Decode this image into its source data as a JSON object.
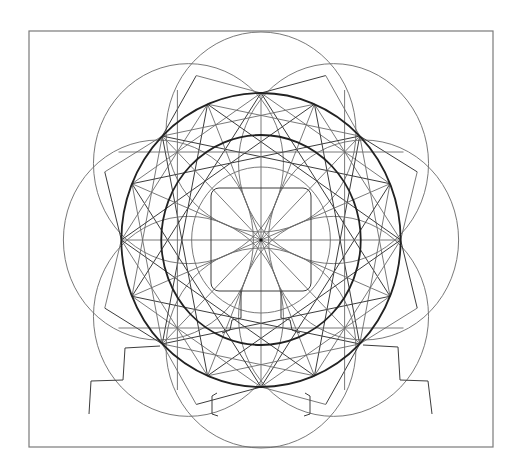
{
  "figure": {
    "frame": {
      "x": 29,
      "y": 31,
      "width": 464,
      "height": 416,
      "color": "#7a7a7a"
    },
    "center": {
      "x": 261,
      "y": 240
    },
    "x_scale": 0.95,
    "ink_colors": {
      "thin": "#6a6a6a",
      "mid": "#3c3c3c",
      "thick": "#222222"
    },
    "outer_circles": {
      "count": 8,
      "radius": 100,
      "center_distance": 108
    },
    "thick_circles": [
      {
        "name": "outer-ring",
        "radius": 147
      },
      {
        "name": "inner-ring",
        "radius": 105
      }
    ],
    "thin_inner_circle": {
      "radius": 73
    },
    "radial_spokes": {
      "count": 16,
      "length": 147
    },
    "inner_square": {
      "x": 211,
      "y": 188,
      "width": 100,
      "height": 103,
      "corner_radius": 8
    },
    "left_step_outline": [
      [
        160,
        346
      ],
      [
        125,
        348
      ],
      [
        123,
        380
      ],
      [
        91,
        381
      ],
      [
        89,
        414
      ]
    ],
    "right_step_outline": [
      [
        363,
        345
      ],
      [
        398,
        347
      ],
      [
        400,
        380
      ],
      [
        428,
        381
      ],
      [
        432,
        414
      ]
    ],
    "bottom_posts": [
      [
        [
          241,
          291
        ],
        [
          241,
          318
        ],
        [
          232,
          320
        ],
        [
          230,
          330
        ],
        [
          222,
          333
        ]
      ],
      [
        [
          281,
          291
        ],
        [
          281,
          318
        ],
        [
          290,
          320
        ],
        [
          292,
          330
        ],
        [
          300,
          333
        ]
      ],
      [
        [
          217,
          393
        ],
        [
          212,
          396
        ],
        [
          212,
          414
        ],
        [
          218,
          416
        ]
      ],
      [
        [
          305,
          393
        ],
        [
          310,
          396
        ],
        [
          310,
          414
        ],
        [
          304,
          416
        ]
      ]
    ]
  }
}
